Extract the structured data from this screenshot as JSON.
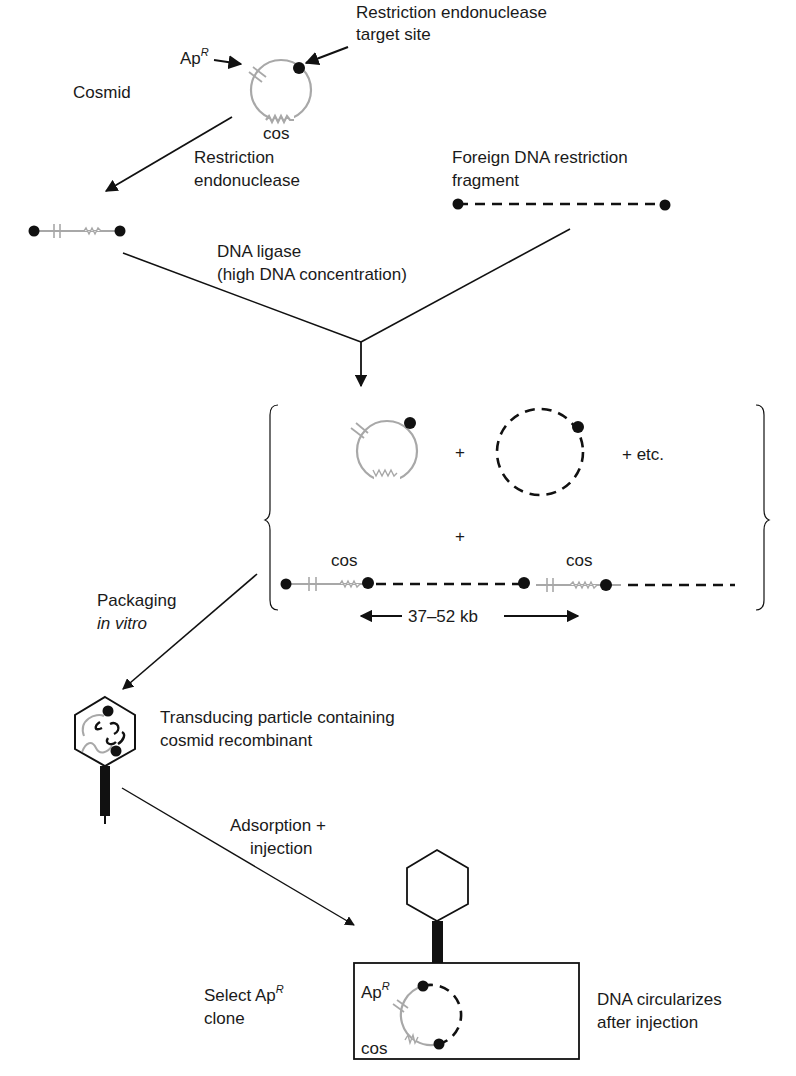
{
  "figure": {
    "cosmid_label": "Cosmid",
    "apr_label": "Ap",
    "apr_superscript": "R",
    "target_site_label_line1": "Restriction endonuclease",
    "target_site_label_line2": "target site",
    "cos_label": "cos",
    "restriction_step_line1": "Restriction",
    "restriction_step_line2": "endonuclease",
    "foreign_dna_line1": "Foreign DNA restriction",
    "foreign_dna_line2": "fragment",
    "ligase_step_line1": "DNA ligase",
    "ligase_step_line2": "(high DNA concentration)",
    "plus": "+",
    "plus_etc": "+ etc.",
    "concatemer_cos_left": "cos",
    "concatemer_cos_right": "cos",
    "size_range": "37–52 kb",
    "packaging_line1": "Packaging",
    "packaging_line2": "in vitro",
    "particle_line1": "Transducing particle containing",
    "particle_line2": "cosmid recombinant",
    "adsorption_line1": "Adsorption +",
    "adsorption_line2": "injection",
    "select_line1": "Select Ap",
    "select_superscript": "R",
    "select_line2": "clone",
    "cell_apr_label": "Ap",
    "cell_apr_superscript": "R",
    "cell_cos_label": "cos",
    "circularize_line1": "DNA circularizes",
    "circularize_line2": "after injection"
  },
  "colors": {
    "vector_dna": "#a8a8a8",
    "foreign_dna": "#111111",
    "text": "#1a1a1a"
  }
}
